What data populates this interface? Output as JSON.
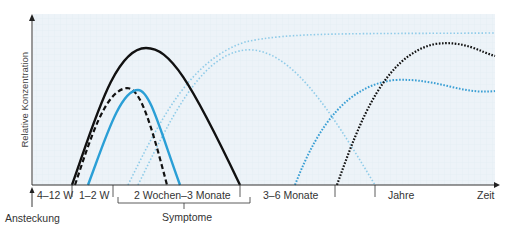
{
  "diagram": {
    "y_axis_label": "Relative Konzentration",
    "x_axis_label": "Zeit",
    "timeline": {
      "segments": [
        {
          "label": "4–12 W",
          "x": 37
        },
        {
          "label": "1–2 W",
          "x": 79
        },
        {
          "label": "2 Wochen–3 Monate",
          "x": 134
        },
        {
          "label": "3–6 Monate",
          "x": 263
        },
        {
          "label": "Jahre",
          "x": 388
        }
      ],
      "separators_x": [
        72,
        113,
        240,
        335,
        375
      ]
    },
    "event_label": "Ansteckung",
    "bracket_label": "Symptome",
    "colors": {
      "black": "#111111",
      "blue": "#2a9fd6",
      "light_blue": "#8fcbe8",
      "dotted_blue": "#3a9fd4",
      "plot_bg": "#edf3f8",
      "grid": "#dfe9f1",
      "axis": "#333333"
    },
    "curves": [
      {
        "name": "black-solid",
        "style": "solid",
        "peak": [
          146,
          48
        ]
      },
      {
        "name": "black-dashed",
        "style": "dashed",
        "peak": [
          127,
          88
        ]
      },
      {
        "name": "blue-solid",
        "style": "solid",
        "peak": [
          138,
          90
        ]
      },
      {
        "name": "light-blue-dotted-plateau",
        "style": "dotted",
        "plateau_y": 33
      },
      {
        "name": "light-blue-dotted-transient",
        "style": "dotted",
        "peak": [
          245,
          50
        ]
      },
      {
        "name": "blue-dotted-late",
        "style": "dotted",
        "peak": [
          395,
          80
        ]
      },
      {
        "name": "black-dotted-late",
        "style": "dotted",
        "peak": [
          435,
          44
        ]
      }
    ]
  }
}
